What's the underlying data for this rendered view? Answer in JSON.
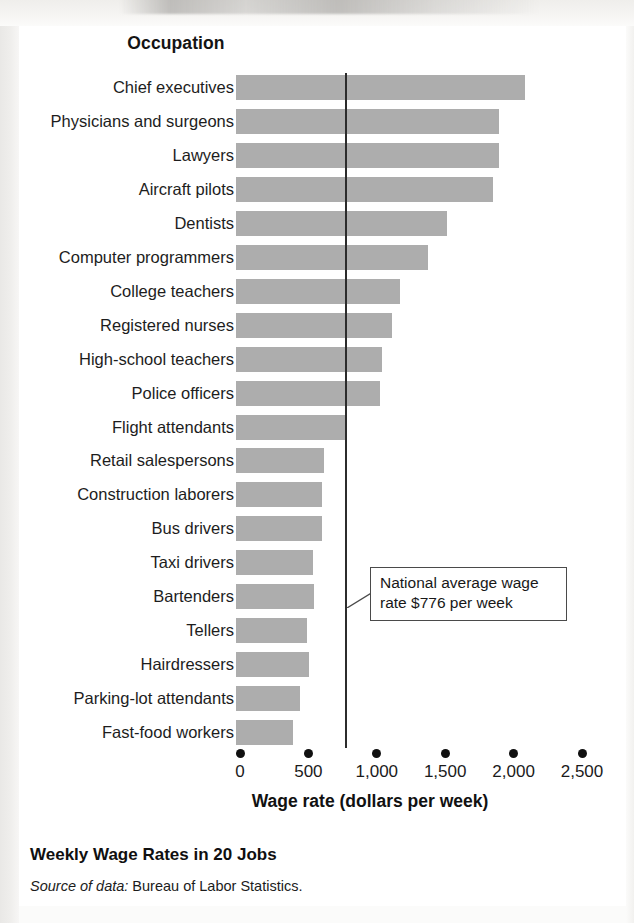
{
  "figure": {
    "category_header": "Occupation",
    "title": "Weekly Wage Rates in 20 Jobs",
    "source_prefix": "Source of data:",
    "source_text": " Bureau of Labor Statistics.",
    "callout_line1": "National average wage",
    "callout_line2": "rate $776 per week",
    "bar_color": "#adadad",
    "reference_line_color": "#2c2c2c",
    "axis_dot_color": "#101010"
  },
  "chart_data": {
    "type": "bar",
    "orientation": "horizontal",
    "title": "Weekly Wage Rates in 20 Jobs",
    "xlabel": "Wage rate (dollars per week)",
    "ylabel": "Occupation",
    "xlim": [
      0,
      2700
    ],
    "xticks": [
      0,
      500,
      1000,
      1500,
      2000,
      2500
    ],
    "xticklabels": [
      "0",
      "500",
      "1,000",
      "1,500",
      "2,000",
      "2,500"
    ],
    "grid": false,
    "legend": null,
    "reference_line": {
      "value": 776,
      "label": "National average wage rate $776 per week"
    },
    "categories": [
      "Chief executives",
      "Physicians and surgeons",
      "Lawyers",
      "Aircraft pilots",
      "Dentists",
      "Computer programmers",
      "College teachers",
      "Registered nurses",
      "High-school teachers",
      "Police officers",
      "Flight attendants",
      "Retail salespersons",
      "Construction laborers",
      "Bus drivers",
      "Taxi drivers",
      "Bartenders",
      "Tellers",
      "Hairdressers",
      "Parking-lot attendants",
      "Fast-food workers"
    ],
    "values": [
      2110,
      1920,
      1920,
      1880,
      1540,
      1400,
      1200,
      1140,
      1070,
      1050,
      810,
      640,
      630,
      630,
      560,
      570,
      520,
      530,
      465,
      420
    ]
  }
}
